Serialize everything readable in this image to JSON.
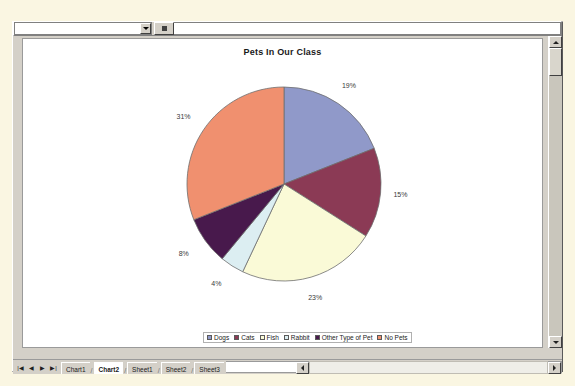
{
  "window": {
    "chart_toolbar": {
      "object_selector_value": "",
      "object_selector_name": "chart-objects-dropdown",
      "format_button_label": ""
    }
  },
  "sheet_tabs": {
    "nav_first": "|◀",
    "nav_prev": "◀",
    "nav_next": "▶",
    "nav_last": "▶|",
    "items": [
      {
        "label": "Chart1",
        "active": false
      },
      {
        "label": "Chart2",
        "active": true
      },
      {
        "label": "Sheet1",
        "active": false
      },
      {
        "label": "Sheet2",
        "active": false
      },
      {
        "label": "Sheet3",
        "active": false
      }
    ]
  },
  "chart_data": {
    "type": "pie",
    "title": "Pets In Our Class",
    "xlabel": "",
    "ylabel": "",
    "grid": false,
    "legend_position": "bottom",
    "categories": [
      "Dogs",
      "Cats",
      "Fish",
      "Rabbit",
      "Other Type of Pet",
      "No Pets"
    ],
    "values": [
      19,
      15,
      23,
      4,
      8,
      31
    ],
    "data_labels": [
      "19%",
      "15%",
      "23%",
      "4%",
      "8%",
      "31%"
    ],
    "colors": [
      "#9099C9",
      "#8B3A55",
      "#FAFAD7",
      "#DCEEF2",
      "#48194C",
      "#F0906F"
    ],
    "label_format": "percentage",
    "start_angle_deg": 0
  }
}
